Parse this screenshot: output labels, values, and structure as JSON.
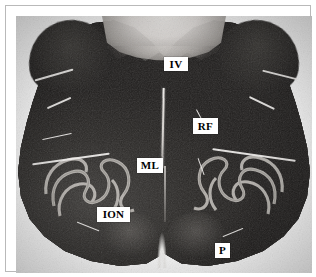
{
  "figure": {
    "kind": "histological-section-photomicrograph",
    "stain_appearance": "grayscale myelin-stained section",
    "background_color": "#ffffff",
    "frame_color": "#b9b9b9",
    "label_box_color": "#ffffff",
    "label_text_color": "#000000"
  },
  "labels": [
    {
      "id": "iv",
      "text": "IV",
      "name": "fourth-ventricle",
      "x": 148,
      "y": 51,
      "w": 24,
      "h": 14,
      "font_size": 11
    },
    {
      "id": "rf",
      "text": "RF",
      "name": "reticular-formation",
      "x": 177,
      "y": 112,
      "w": 25,
      "h": 16,
      "font_size": 11
    },
    {
      "id": "ml",
      "text": "ML",
      "name": "medial-lemniscus",
      "x": 121,
      "y": 152,
      "w": 26,
      "h": 15,
      "font_size": 11
    },
    {
      "id": "ion",
      "text": "ION",
      "name": "inferior-olivary-nucleus",
      "x": 81,
      "y": 201,
      "w": 33,
      "h": 15,
      "font_size": 11
    },
    {
      "id": "p",
      "text": "P",
      "name": "pyramid",
      "x": 199,
      "y": 237,
      "w": 15,
      "h": 15,
      "font_size": 11
    }
  ],
  "legend_expansions": {
    "IV": "fourth ventricle",
    "RF": "reticular formation",
    "ML": "medial lemniscus",
    "ION": "inferior olivary nucleus",
    "P": "pyramid"
  }
}
